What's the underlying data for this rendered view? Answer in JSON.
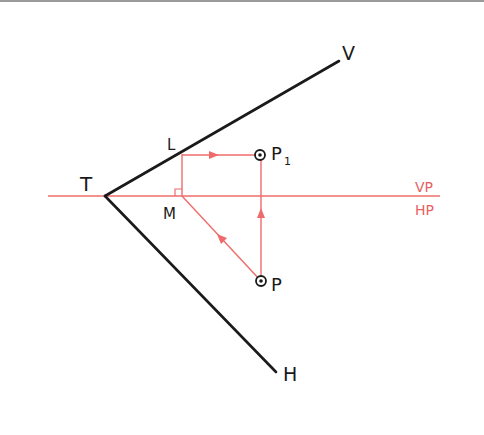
{
  "diagram": {
    "colors": {
      "black": "#1a1a1a",
      "red": "#ef6b6b",
      "red_text": "#e85f5f"
    },
    "reference_line": {
      "labels": {
        "above": "VP",
        "below": "HP"
      }
    },
    "points": {
      "T": {
        "label": "T",
        "x": 105,
        "y": 196
      },
      "V_end": {
        "label": "V",
        "x": 339,
        "y": 61
      },
      "H_end": {
        "label": "H",
        "x": 276,
        "y": 372
      },
      "L": {
        "label": "L",
        "x": 182,
        "y": 154
      },
      "M": {
        "label": "M",
        "x": 182,
        "y": 196
      },
      "P1": {
        "label": "P",
        "subscript": "1",
        "x": 260,
        "y": 155
      },
      "P": {
        "label": "P",
        "x": 261,
        "y": 281
      }
    },
    "construction": [
      {
        "from": "P",
        "to": "M",
        "arrow_direction": "up-left"
      },
      {
        "from": "M",
        "to": "L",
        "arrow_direction": "none",
        "right_angle_at": "M"
      },
      {
        "from": "L",
        "to": "P1",
        "arrow_direction": "right"
      },
      {
        "from": "P",
        "to": "P1",
        "arrow_direction": "up"
      }
    ]
  }
}
